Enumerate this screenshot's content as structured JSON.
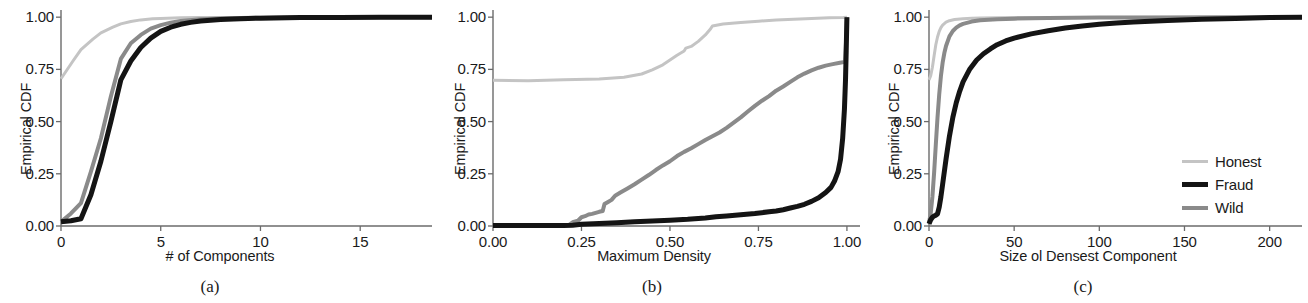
{
  "figure": {
    "background": "#ffffff",
    "subcaptions": [
      "(a)",
      "(b)",
      "(c)"
    ]
  },
  "legend": {
    "position": "right-center",
    "entries": [
      {
        "label": "Honest",
        "color": "#c4c4c4",
        "width": 3
      },
      {
        "label": "Fraud",
        "color": "#141414",
        "width": 5
      },
      {
        "label": "Wild",
        "color": "#8a8a8a",
        "width": 4
      }
    ]
  },
  "chart_data": [
    {
      "type": "line",
      "panel": "(a)",
      "title": "",
      "xlabel": "# of Components",
      "ylabel": "Empirical CDF",
      "xlim": [
        0,
        18.6
      ],
      "ylim": [
        0.0,
        1.02
      ],
      "xticks": [
        0,
        5,
        10,
        15
      ],
      "xticklabels": [
        "0",
        "5",
        "10",
        "15"
      ],
      "yticks": [
        0.0,
        0.25,
        0.5,
        0.75,
        1.0
      ],
      "yticklabels": [
        "0.00",
        "0.25",
        "0.50",
        "0.75",
        "1.00"
      ],
      "grid": false,
      "series": [
        {
          "name": "Honest",
          "color": "#c4c4c4",
          "width": 3,
          "x": [
            0,
            0.6,
            1,
            1.6,
            2,
            2.6,
            3,
            3.5,
            4,
            4.6,
            5,
            6,
            7,
            8,
            10,
            12,
            14,
            16,
            18.6
          ],
          "y": [
            0.705,
            0.79,
            0.845,
            0.895,
            0.925,
            0.952,
            0.968,
            0.979,
            0.987,
            0.992,
            0.994,
            0.997,
            0.998,
            0.999,
            0.999,
            1.0,
            1.0,
            1.0,
            1.0
          ]
        },
        {
          "name": "Wild",
          "color": "#8a8a8a",
          "width": 4,
          "x": [
            0,
            0.5,
            1,
            1.5,
            2,
            2.5,
            3,
            3.5,
            4,
            4.5,
            5,
            5.5,
            6,
            7,
            8,
            9,
            10,
            12,
            14,
            16,
            18.6
          ],
          "y": [
            0.02,
            0.06,
            0.11,
            0.26,
            0.42,
            0.62,
            0.8,
            0.875,
            0.915,
            0.945,
            0.962,
            0.974,
            0.982,
            0.99,
            0.994,
            0.996,
            0.997,
            0.998,
            0.999,
            1.0,
            1.0
          ]
        },
        {
          "name": "Fraud",
          "color": "#141414",
          "width": 5,
          "x": [
            0,
            0.5,
            1,
            1.5,
            2,
            2.5,
            3,
            3.5,
            4,
            4.5,
            5,
            5.5,
            6,
            6.5,
            7,
            8,
            9,
            10,
            12,
            14,
            16,
            18.6
          ],
          "y": [
            0.02,
            0.025,
            0.035,
            0.15,
            0.31,
            0.5,
            0.7,
            0.79,
            0.855,
            0.9,
            0.932,
            0.952,
            0.966,
            0.975,
            0.982,
            0.989,
            0.993,
            0.995,
            0.998,
            0.999,
            1.0,
            1.0
          ]
        }
      ]
    },
    {
      "type": "line",
      "panel": "(b)",
      "title": "",
      "xlabel": "Maximum Density",
      "ylabel": "Empirical CDF",
      "xlim": [
        0.0,
        1.02
      ],
      "ylim": [
        0.0,
        1.02
      ],
      "xticks": [
        0.0,
        0.25,
        0.5,
        0.75,
        1.0
      ],
      "xticklabels": [
        "0.00",
        "0.25",
        "0.50",
        "0.75",
        "1.00"
      ],
      "yticks": [
        0.0,
        0.25,
        0.5,
        0.75,
        1.0
      ],
      "yticklabels": [
        "0.00",
        "0.25",
        "0.50",
        "0.75",
        "1.00"
      ],
      "grid": false,
      "series": [
        {
          "name": "Honest",
          "color": "#c4c4c4",
          "width": 3,
          "x": [
            0.0,
            0.1,
            0.2,
            0.3,
            0.37,
            0.42,
            0.45,
            0.48,
            0.5,
            0.52,
            0.54,
            0.545,
            0.56,
            0.58,
            0.6,
            0.615,
            0.62,
            0.65,
            0.7,
            0.75,
            0.8,
            0.85,
            0.9,
            0.95,
            0.99,
            1.0
          ],
          "y": [
            0.698,
            0.696,
            0.7,
            0.704,
            0.712,
            0.728,
            0.748,
            0.772,
            0.795,
            0.818,
            0.838,
            0.852,
            0.86,
            0.884,
            0.915,
            0.945,
            0.958,
            0.967,
            0.975,
            0.981,
            0.986,
            0.99,
            0.994,
            0.997,
            0.999,
            1.0
          ]
        },
        {
          "name": "Wild",
          "color": "#8a8a8a",
          "width": 4,
          "x": [
            0.0,
            0.215,
            0.225,
            0.24,
            0.25,
            0.26,
            0.27,
            0.28,
            0.29,
            0.3,
            0.31,
            0.315,
            0.325,
            0.335,
            0.345,
            0.36,
            0.38,
            0.4,
            0.42,
            0.44,
            0.46,
            0.48,
            0.5,
            0.52,
            0.54,
            0.56,
            0.58,
            0.6,
            0.62,
            0.64,
            0.66,
            0.68,
            0.7,
            0.72,
            0.74,
            0.76,
            0.78,
            0.8,
            0.82,
            0.84,
            0.86,
            0.88,
            0.9,
            0.92,
            0.94,
            0.96,
            0.98,
            0.995,
            0.998,
            1.0
          ],
          "y": [
            0.004,
            0.005,
            0.018,
            0.025,
            0.042,
            0.047,
            0.055,
            0.058,
            0.063,
            0.068,
            0.072,
            0.105,
            0.115,
            0.125,
            0.145,
            0.16,
            0.18,
            0.2,
            0.222,
            0.244,
            0.268,
            0.29,
            0.31,
            0.335,
            0.355,
            0.372,
            0.392,
            0.412,
            0.43,
            0.448,
            0.47,
            0.495,
            0.52,
            0.548,
            0.575,
            0.6,
            0.622,
            0.648,
            0.668,
            0.69,
            0.712,
            0.73,
            0.745,
            0.758,
            0.768,
            0.775,
            0.782,
            0.786,
            0.9,
            1.0
          ]
        },
        {
          "name": "Fraud",
          "color": "#141414",
          "width": 5,
          "x": [
            0.0,
            0.2,
            0.225,
            0.25,
            0.3,
            0.35,
            0.4,
            0.45,
            0.5,
            0.55,
            0.6,
            0.63,
            0.66,
            0.7,
            0.74,
            0.78,
            0.8,
            0.82,
            0.84,
            0.86,
            0.88,
            0.9,
            0.92,
            0.94,
            0.955,
            0.965,
            0.975,
            0.982,
            0.988,
            0.993,
            0.996,
            0.998,
            1.0
          ],
          "y": [
            0.002,
            0.002,
            0.004,
            0.008,
            0.012,
            0.016,
            0.02,
            0.024,
            0.028,
            0.032,
            0.038,
            0.044,
            0.048,
            0.054,
            0.06,
            0.068,
            0.072,
            0.078,
            0.086,
            0.094,
            0.104,
            0.118,
            0.135,
            0.16,
            0.185,
            0.215,
            0.26,
            0.32,
            0.42,
            0.56,
            0.7,
            0.84,
            1.0
          ]
        }
      ]
    },
    {
      "type": "line",
      "panel": "(c)",
      "title": "",
      "xlabel": "Size ol Densest Component",
      "ylabel": "Empirical CDF",
      "xlim": [
        0,
        219
      ],
      "ylim": [
        0.0,
        1.02
      ],
      "xticks": [
        0,
        50,
        100,
        150,
        200
      ],
      "xticklabels": [
        "0",
        "50",
        "100",
        "150",
        "200"
      ],
      "yticks": [
        0.0,
        0.25,
        0.5,
        0.75,
        1.0
      ],
      "yticklabels": [
        "0.00",
        "0.25",
        "0.50",
        "0.75",
        "1.00"
      ],
      "grid": false,
      "series": [
        {
          "name": "Honest",
          "color": "#c4c4c4",
          "width": 3,
          "x": [
            0,
            1,
            2,
            3,
            4,
            5,
            6,
            7,
            8,
            10,
            12,
            15,
            20,
            25,
            30,
            40,
            50,
            70,
            100,
            140,
            180,
            219
          ],
          "y": [
            0.7,
            0.72,
            0.76,
            0.815,
            0.868,
            0.905,
            0.932,
            0.95,
            0.962,
            0.976,
            0.983,
            0.989,
            0.993,
            0.995,
            0.996,
            0.997,
            0.998,
            0.999,
            0.999,
            1.0,
            1.0,
            1.0
          ]
        },
        {
          "name": "Wild",
          "color": "#8a8a8a",
          "width": 4,
          "x": [
            0,
            1,
            2,
            3,
            4,
            5,
            6,
            7,
            8,
            9,
            10,
            12,
            14,
            16,
            18,
            20,
            25,
            30,
            40,
            50,
            70,
            100,
            140,
            180,
            219
          ],
          "y": [
            0.015,
            0.06,
            0.14,
            0.255,
            0.39,
            0.52,
            0.63,
            0.718,
            0.782,
            0.828,
            0.862,
            0.908,
            0.934,
            0.95,
            0.961,
            0.968,
            0.979,
            0.985,
            0.99,
            0.993,
            0.996,
            0.998,
            0.999,
            1.0,
            1.0
          ]
        },
        {
          "name": "Fraud",
          "color": "#141414",
          "width": 5,
          "x": [
            0,
            1,
            2,
            3,
            4,
            5,
            6,
            7,
            8,
            10,
            12,
            14,
            16,
            18,
            20,
            24,
            28,
            32,
            36,
            40,
            45,
            50,
            60,
            70,
            80,
            90,
            100,
            110,
            120,
            140,
            160,
            180,
            200,
            219
          ],
          "y": [
            0.01,
            0.03,
            0.042,
            0.048,
            0.052,
            0.058,
            0.09,
            0.14,
            0.2,
            0.32,
            0.43,
            0.52,
            0.59,
            0.645,
            0.69,
            0.752,
            0.795,
            0.825,
            0.848,
            0.868,
            0.886,
            0.9,
            0.92,
            0.935,
            0.948,
            0.958,
            0.966,
            0.972,
            0.977,
            0.984,
            0.99,
            0.994,
            0.998,
            1.0
          ]
        }
      ]
    }
  ]
}
